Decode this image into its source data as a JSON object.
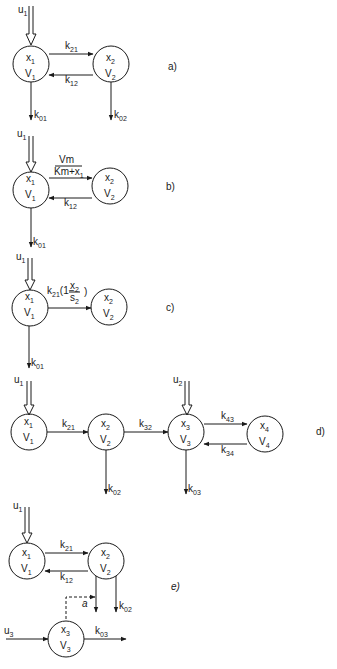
{
  "diagram": {
    "type": "compartmental-models",
    "panels": [
      {
        "id": "a",
        "label": "a)",
        "compartments": [
          {
            "id": "1",
            "state": "x",
            "sub": "1",
            "vol": "V",
            "vsub": "1"
          },
          {
            "id": "2",
            "state": "x",
            "sub": "2",
            "vol": "V",
            "vsub": "2"
          }
        ],
        "input": {
          "name": "u",
          "sub": "1"
        },
        "edges": [
          {
            "from": "1",
            "to": "2",
            "k": "k",
            "sub": "21"
          },
          {
            "from": "2",
            "to": "1",
            "k": "k",
            "sub": "12"
          },
          {
            "from": "1",
            "to": "out",
            "k": "k",
            "sub": "01"
          },
          {
            "from": "2",
            "to": "out",
            "k": "k",
            "sub": "02"
          }
        ]
      },
      {
        "id": "b",
        "label": "b)",
        "compartments": [
          {
            "id": "1",
            "state": "x",
            "sub": "1",
            "vol": "V",
            "vsub": "1"
          },
          {
            "id": "2",
            "state": "x",
            "sub": "2",
            "vol": "V",
            "vsub": "2"
          }
        ],
        "input": {
          "name": "u",
          "sub": "1"
        },
        "edges": [
          {
            "from": "1",
            "to": "2",
            "num": "Vm",
            "den": "Km+x",
            "densub": "1"
          },
          {
            "from": "2",
            "to": "1",
            "k": "k",
            "sub": "12"
          },
          {
            "from": "1",
            "to": "out",
            "k": "k",
            "sub": "01"
          }
        ]
      },
      {
        "id": "c",
        "label": "c)",
        "compartments": [
          {
            "id": "1",
            "state": "x",
            "sub": "1",
            "vol": "V",
            "vsub": "1"
          },
          {
            "id": "2",
            "state": "x",
            "sub": "2",
            "vol": "V",
            "vsub": "2"
          }
        ],
        "input": {
          "name": "u",
          "sub": "1"
        },
        "edges": [
          {
            "from": "1",
            "to": "2",
            "k": "k",
            "sub": "21",
            "factor_pre": "(1−",
            "num": "x",
            "numsub": "2",
            "den": "s",
            "densub": "2",
            "factor_post": ")"
          },
          {
            "from": "1",
            "to": "out",
            "k": "k",
            "sub": "01"
          }
        ]
      },
      {
        "id": "d",
        "label": "d)",
        "compartments": [
          {
            "id": "1",
            "state": "x",
            "sub": "1",
            "vol": "V",
            "vsub": "1"
          },
          {
            "id": "2",
            "state": "x",
            "sub": "2",
            "vol": "V",
            "vsub": "2"
          },
          {
            "id": "3",
            "state": "x",
            "sub": "3",
            "vol": "V",
            "vsub": "3"
          },
          {
            "id": "4",
            "state": "x",
            "sub": "4",
            "vol": "V",
            "vsub": "4"
          }
        ],
        "inputs": [
          {
            "name": "u",
            "sub": "1"
          },
          {
            "name": "u",
            "sub": "2"
          }
        ],
        "edges": [
          {
            "from": "1",
            "to": "2",
            "k": "k",
            "sub": "21"
          },
          {
            "from": "2",
            "to": "3",
            "k": "k",
            "sub": "32"
          },
          {
            "from": "3",
            "to": "4",
            "k": "k",
            "sub": "43"
          },
          {
            "from": "4",
            "to": "3",
            "k": "k",
            "sub": "34"
          },
          {
            "from": "2",
            "to": "out",
            "k": "k",
            "sub": "02"
          },
          {
            "from": "3",
            "to": "out",
            "k": "k",
            "sub": "03"
          }
        ]
      },
      {
        "id": "e",
        "label": "e)",
        "compartments": [
          {
            "id": "1",
            "state": "x",
            "sub": "1",
            "vol": "V",
            "vsub": "1"
          },
          {
            "id": "2",
            "state": "x",
            "sub": "2",
            "vol": "V",
            "vsub": "2"
          },
          {
            "id": "3",
            "state": "x",
            "sub": "3",
            "vol": "V",
            "vsub": "3"
          }
        ],
        "inputs": [
          {
            "name": "u",
            "sub": "1"
          },
          {
            "name": "u",
            "sub": "3"
          }
        ],
        "control": {
          "symbol": "a",
          "from": "3",
          "to": "2-out",
          "style": "dashed"
        },
        "edges": [
          {
            "from": "1",
            "to": "2",
            "k": "k",
            "sub": "21"
          },
          {
            "from": "2",
            "to": "1",
            "k": "k",
            "sub": "12"
          },
          {
            "from": "2",
            "to": "out",
            "k": "",
            "sub": ""
          },
          {
            "from": "2",
            "to": "out",
            "k": "k",
            "sub": "02"
          },
          {
            "from": "3",
            "to": "out",
            "k": "k",
            "sub": "03"
          }
        ]
      }
    ]
  }
}
